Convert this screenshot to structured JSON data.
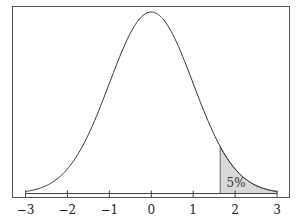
{
  "chart_data": {
    "type": "line",
    "title": "",
    "subtitle": "",
    "xlabel": "",
    "ylabel": "",
    "xlim": [
      -3,
      3
    ],
    "x_ticks": [
      -3,
      -2,
      -1,
      0,
      1,
      2,
      3
    ],
    "x_tick_labels": [
      "−3",
      "−2",
      "−1",
      "0",
      "1",
      "2",
      "3"
    ],
    "y_ticks": [],
    "grid": false,
    "legend": null,
    "series": [
      {
        "name": "normal-density",
        "distribution": "standard normal",
        "mean": 0,
        "sd": 1,
        "color": "#333333"
      }
    ],
    "shaded_region": {
      "from": 1.645,
      "to": 3,
      "fill": "#d9d9d9",
      "label": "5%"
    },
    "annotations": [
      {
        "text": "5%",
        "x": 2.0,
        "position": "inside shaded tail"
      }
    ]
  }
}
